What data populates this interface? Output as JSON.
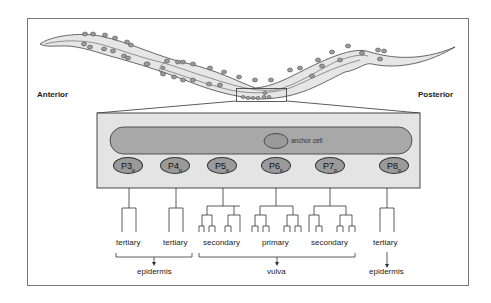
{
  "figure": {
    "orientation": {
      "anterior": "Anterior",
      "posterior": "Posterior"
    },
    "anchor_cell_label": "anchor cell",
    "precursor_cells": [
      {
        "name": "P3",
        "sub": "p",
        "fate": "tertiary"
      },
      {
        "name": "P4",
        "sub": "p",
        "fate": "tertiary"
      },
      {
        "name": "P5",
        "sub": "p",
        "fate": "secondary"
      },
      {
        "name": "P6",
        "sub": "p",
        "fate": "primary"
      },
      {
        "name": "P7",
        "sub": "p",
        "fate": "secondary"
      },
      {
        "name": "P8",
        "sub": "p",
        "fate": "tertiary"
      }
    ],
    "outcomes": [
      {
        "label": "epidermis",
        "covers": [
          "P3",
          "P4"
        ]
      },
      {
        "label": "vulva",
        "covers": [
          "P5",
          "P6",
          "P7"
        ]
      },
      {
        "label": "epidermis",
        "covers": [
          "P8"
        ]
      }
    ],
    "colors": {
      "worm_fill": "#e6e6e6",
      "cell_fill": "#9a9a9a",
      "gonad_fill": "#a8a8a8",
      "box_fill": "#e4e4e4",
      "stroke": "#333333"
    }
  }
}
